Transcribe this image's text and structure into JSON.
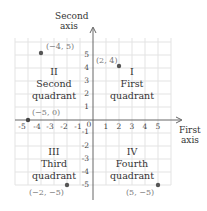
{
  "axes": {
    "y_label_line1": "Second",
    "y_label_line2": "axis",
    "x_label_line1": "First",
    "x_label_line2": "axis",
    "x_ticks": [
      "-5",
      "-4",
      "-3",
      "-2",
      "-1",
      "1",
      "2",
      "3",
      "4",
      "5"
    ],
    "y_ticks": [
      "5",
      "4",
      "3",
      "2",
      "1",
      "-1",
      "-2",
      "-3",
      "-4",
      "-5"
    ],
    "origin": "0"
  },
  "quadrants": [
    {
      "numeral": "I",
      "name_line1": "First",
      "name_line2": "quadrant"
    },
    {
      "numeral": "II",
      "name_line1": "Second",
      "name_line2": "quadrant"
    },
    {
      "numeral": "III",
      "name_line1": "Third",
      "name_line2": "quadrant"
    },
    {
      "numeral": "IV",
      "name_line1": "Fourth",
      "name_line2": "quadrant"
    }
  ],
  "points": [
    {
      "label": "(−4, 5)",
      "x": -4,
      "y": 5
    },
    {
      "label": "(2, 4)",
      "x": 2,
      "y": 4
    },
    {
      "label": "(−5, 0)",
      "x": -5,
      "y": 0
    },
    {
      "label": "(−2, −5)",
      "x": -2,
      "y": -5
    },
    {
      "label": "(5, −5)",
      "x": 5,
      "y": -5
    }
  ],
  "colors": {
    "grid": "#e3e3e3",
    "axis": "#666666",
    "point": "#555555"
  }
}
